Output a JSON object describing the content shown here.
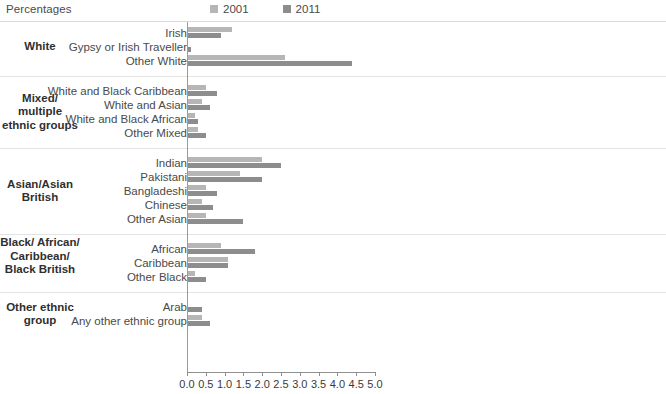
{
  "header": {
    "percentages_label": "Percentages"
  },
  "legend": {
    "items": [
      {
        "label": "2001",
        "color": "#b6b6b6"
      },
      {
        "label": "2011",
        "color": "#8d8d8d"
      }
    ]
  },
  "colors": {
    "bar_2001": "#b6b6b6",
    "bar_2011": "#8d8d8d",
    "axis": "#8f8f8f",
    "text": "#4a4a4a",
    "rule": "#e3e3e3"
  },
  "chart_data": {
    "type": "bar",
    "orientation": "horizontal",
    "title": "Percentages",
    "xlabel": "",
    "ylabel": "",
    "xlim": [
      0.0,
      5.0
    ],
    "grid": false,
    "legend_position": "top-right",
    "tick_labels": [
      "0.0",
      "0.5",
      "1.0",
      "1.5",
      "2.0",
      "2.5",
      "3.0",
      "3.5",
      "4.0",
      "4.5",
      "5.0"
    ],
    "ticks": [
      0.0,
      0.5,
      1.0,
      1.5,
      2.0,
      2.5,
      3.0,
      3.5,
      4.0,
      4.5,
      5.0
    ],
    "series": [
      {
        "name": "2001",
        "color": "#b6b6b6"
      },
      {
        "name": "2011",
        "color": "#8d8d8d"
      }
    ],
    "groups": [
      {
        "group": "White",
        "categories": [
          {
            "label": "Irish",
            "values": [
              1.2,
              0.9
            ]
          },
          {
            "label": "Gypsy or Irish Traveller",
            "values": [
              0.0,
              0.1
            ]
          },
          {
            "label": "Other White",
            "values": [
              2.6,
              4.4
            ]
          }
        ]
      },
      {
        "group": "Mixed/ multiple ethnic groups",
        "categories": [
          {
            "label": "White and Black Caribbean",
            "values": [
              0.5,
              0.8
            ]
          },
          {
            "label": "White and Asian",
            "values": [
              0.4,
              0.6
            ]
          },
          {
            "label": "White and Black African",
            "values": [
              0.2,
              0.3
            ]
          },
          {
            "label": "Other Mixed",
            "values": [
              0.3,
              0.5
            ]
          }
        ]
      },
      {
        "group": "Asian/Asian British",
        "categories": [
          {
            "label": "Indian",
            "values": [
              2.0,
              2.5
            ]
          },
          {
            "label": "Pakistani",
            "values": [
              1.4,
              2.0
            ]
          },
          {
            "label": "Bangladeshi",
            "values": [
              0.5,
              0.8
            ]
          },
          {
            "label": "Chinese",
            "values": [
              0.4,
              0.7
            ]
          },
          {
            "label": "Other Asian",
            "values": [
              0.5,
              1.5
            ]
          }
        ]
      },
      {
        "group": "Black/ African/ Caribbean/ Black British",
        "categories": [
          {
            "label": "African",
            "values": [
              0.9,
              1.8
            ]
          },
          {
            "label": "Caribbean",
            "values": [
              1.1,
              1.1
            ]
          },
          {
            "label": "Other Black",
            "values": [
              0.2,
              0.5
            ]
          }
        ]
      },
      {
        "group": "Other ethnic group",
        "categories": [
          {
            "label": "Arab",
            "values": [
              0.0,
              0.4
            ]
          },
          {
            "label": "Any other ethnic group",
            "values": [
              0.4,
              0.6
            ]
          }
        ]
      }
    ]
  }
}
